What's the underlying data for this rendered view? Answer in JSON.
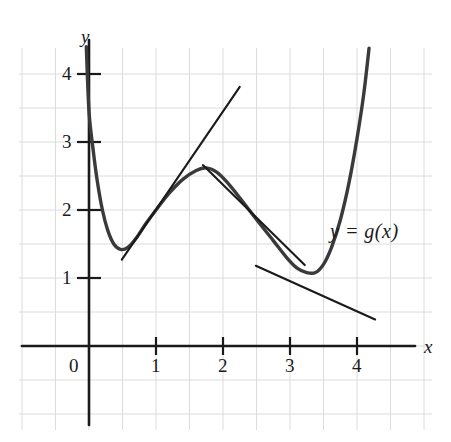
{
  "figure": {
    "background_color": "#ffffff",
    "grid_color": "#dcdcdc",
    "ink_color": "#1a1a1a",
    "curve_color": "#3a3a3a"
  },
  "axes": {
    "x_axis_name": "x",
    "y_axis_name": "y",
    "origin_label": "0",
    "x_ticks": [
      {
        "label": "1",
        "value": 1
      },
      {
        "label": "2",
        "value": 2
      },
      {
        "label": "3",
        "value": 3
      },
      {
        "label": "4",
        "value": 4
      }
    ],
    "y_ticks": [
      {
        "label": "1",
        "value": 1
      },
      {
        "label": "2",
        "value": 2
      },
      {
        "label": "3",
        "value": 3
      },
      {
        "label": "4",
        "value": 4
      }
    ]
  },
  "annotations": {
    "curve_label": "y = g(x)"
  },
  "chart_data": {
    "type": "line",
    "title": "",
    "xlabel": "x",
    "ylabel": "y",
    "xlim": [
      -1.05,
      5.4
    ],
    "ylim": [
      -1.45,
      4.4
    ],
    "grid": true,
    "grid_step": 0.5,
    "legend": "none",
    "series": [
      {
        "name": "y = g(x)",
        "role": "curve",
        "points": [
          [
            -0.04,
            4.4
          ],
          [
            0.0,
            3.45
          ],
          [
            0.06,
            2.9
          ],
          [
            0.12,
            2.45
          ],
          [
            0.2,
            2.0
          ],
          [
            0.28,
            1.7
          ],
          [
            0.37,
            1.5
          ],
          [
            0.47,
            1.42
          ],
          [
            0.58,
            1.45
          ],
          [
            0.7,
            1.58
          ],
          [
            0.85,
            1.8
          ],
          [
            1.0,
            2.0
          ],
          [
            1.2,
            2.25
          ],
          [
            1.4,
            2.45
          ],
          [
            1.6,
            2.58
          ],
          [
            1.75,
            2.62
          ],
          [
            1.9,
            2.56
          ],
          [
            2.05,
            2.42
          ],
          [
            2.25,
            2.18
          ],
          [
            2.5,
            1.86
          ],
          [
            2.75,
            1.55
          ],
          [
            2.95,
            1.3
          ],
          [
            3.1,
            1.15
          ],
          [
            3.25,
            1.08
          ],
          [
            3.38,
            1.08
          ],
          [
            3.5,
            1.2
          ],
          [
            3.62,
            1.45
          ],
          [
            3.75,
            1.85
          ],
          [
            3.88,
            2.4
          ],
          [
            4.0,
            3.05
          ],
          [
            4.1,
            3.7
          ],
          [
            4.18,
            4.38
          ]
        ]
      },
      {
        "name": "tangent-at-x-1",
        "role": "tangent",
        "tangent_point": [
          1.0,
          2.0
        ],
        "endpoints": [
          [
            0.49,
            1.27
          ],
          [
            2.25,
            3.81
          ]
        ]
      },
      {
        "name": "tangent-at-x-2",
        "role": "tangent",
        "tangent_point": [
          2.0,
          2.45
        ],
        "endpoints": [
          [
            1.7,
            2.66
          ],
          [
            3.22,
            1.19
          ]
        ]
      },
      {
        "name": "tangent-at-x-3",
        "role": "tangent",
        "tangent_point": [
          3.0,
          1.25
        ],
        "endpoints": [
          [
            2.49,
            1.18
          ],
          [
            4.27,
            0.39
          ]
        ]
      }
    ]
  },
  "geometry": {
    "note": "pixel mapping used by renderer",
    "x_origin_px": 89,
    "y_origin_px": 346,
    "px_per_unit_x": 67,
    "px_per_unit_y": 68
  }
}
